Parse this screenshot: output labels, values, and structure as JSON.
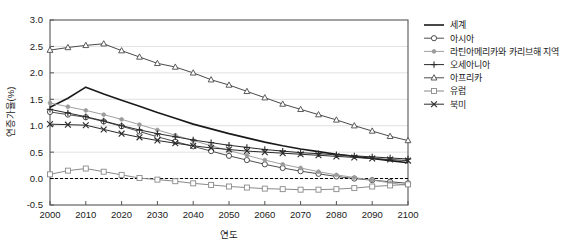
{
  "chart_data": {
    "type": "line",
    "title": "",
    "xlabel": "연도",
    "ylabel": "연증가율(%)",
    "xlim": [
      2000,
      2100
    ],
    "ylim": [
      -0.5,
      3.0
    ],
    "ytick_labels": [
      "3.0",
      "2.5",
      "2.0",
      "1.5",
      "1.0",
      "0.5",
      "0.0",
      "-0.5"
    ],
    "ytick_values": [
      3.0,
      2.5,
      2.0,
      1.5,
      1.0,
      0.5,
      0.0,
      -0.5
    ],
    "xtick_labels": [
      "2000",
      "2010",
      "2020",
      "2030",
      "2040",
      "2050",
      "2060",
      "2070",
      "2080",
      "2090",
      "2100"
    ],
    "xtick_values": [
      2000,
      2010,
      2020,
      2030,
      2040,
      2050,
      2060,
      2070,
      2080,
      2090,
      2100
    ],
    "grid": "horizontal",
    "legend_position": "right",
    "zero_reference_line": 0.0,
    "x": [
      2000,
      2005,
      2010,
      2015,
      2020,
      2025,
      2030,
      2035,
      2040,
      2045,
      2050,
      2055,
      2060,
      2065,
      2070,
      2075,
      2080,
      2085,
      2090,
      2095,
      2100
    ],
    "series": [
      {
        "name": "세계",
        "marker": "none",
        "color": "#1a1a1a",
        "width": 1.6,
        "values": [
          1.35,
          1.52,
          1.73,
          1.6,
          1.48,
          1.37,
          1.25,
          1.14,
          1.03,
          0.94,
          0.85,
          0.77,
          0.69,
          0.62,
          0.56,
          0.51,
          0.46,
          0.42,
          0.38,
          0.34,
          0.3
        ]
      },
      {
        "name": "아시아",
        "marker": "circle-open",
        "color": "#3a3a3a",
        "width": 0.9,
        "values": [
          1.26,
          1.21,
          1.16,
          1.08,
          0.99,
          0.89,
          0.79,
          0.7,
          0.61,
          0.52,
          0.43,
          0.35,
          0.27,
          0.2,
          0.14,
          0.09,
          0.04,
          0.0,
          -0.03,
          -0.06,
          -0.09
        ]
      },
      {
        "name": "라틴아메리카와 카리브해 지역",
        "marker": "dot-small",
        "color": "#a0a0a0",
        "width": 1.0,
        "values": [
          1.43,
          1.36,
          1.29,
          1.21,
          1.12,
          1.02,
          0.92,
          0.82,
          0.72,
          0.62,
          0.53,
          0.44,
          0.35,
          0.27,
          0.2,
          0.13,
          0.07,
          0.02,
          -0.03,
          -0.08,
          -0.13
        ]
      },
      {
        "name": "오세아니아",
        "marker": "plus",
        "color": "#2a2a2a",
        "width": 1.0,
        "values": [
          1.31,
          1.24,
          1.17,
          1.09,
          1.0,
          0.92,
          0.85,
          0.79,
          0.73,
          0.68,
          0.63,
          0.59,
          0.55,
          0.52,
          0.49,
          0.47,
          0.45,
          0.43,
          0.41,
          0.39,
          0.37
        ]
      },
      {
        "name": "아프리카",
        "marker": "triangle-open",
        "color": "#4a4a4a",
        "width": 1.0,
        "values": [
          2.43,
          2.48,
          2.52,
          2.55,
          2.42,
          2.3,
          2.18,
          2.11,
          2.0,
          1.87,
          1.77,
          1.65,
          1.53,
          1.41,
          1.31,
          1.21,
          1.11,
          1.0,
          0.9,
          0.8,
          0.72
        ]
      },
      {
        "name": "유럽",
        "marker": "square-open",
        "color": "#8a8a8a",
        "width": 1.0,
        "values": [
          0.08,
          0.15,
          0.19,
          0.13,
          0.07,
          0.01,
          -0.02,
          -0.05,
          -0.09,
          -0.12,
          -0.15,
          -0.17,
          -0.19,
          -0.2,
          -0.21,
          -0.21,
          -0.2,
          -0.18,
          -0.15,
          -0.13,
          -0.11
        ]
      },
      {
        "name": "북미",
        "marker": "x",
        "color": "#2a2a2a",
        "width": 1.0,
        "values": [
          1.03,
          1.02,
          1.01,
          0.93,
          0.85,
          0.78,
          0.72,
          0.67,
          0.62,
          0.58,
          0.55,
          0.52,
          0.5,
          0.48,
          0.46,
          0.44,
          0.42,
          0.4,
          0.38,
          0.36,
          0.34
        ]
      }
    ]
  },
  "legend": {
    "items": [
      {
        "label": "세계",
        "marker": "none"
      },
      {
        "label": "아시아",
        "marker": "circle-open"
      },
      {
        "label": "라틴아메리카와 카리브해 지역",
        "marker": "dot-small"
      },
      {
        "label": "오세아니아",
        "marker": "plus"
      },
      {
        "label": "아프리카",
        "marker": "triangle-open"
      },
      {
        "label": "유럽",
        "marker": "square-open"
      },
      {
        "label": "북미",
        "marker": "x"
      }
    ]
  },
  "colors": {
    "plot_border": "#555555",
    "grid": "#d9d9d9",
    "background": "#ffffff",
    "zero_line": "#000000"
  }
}
